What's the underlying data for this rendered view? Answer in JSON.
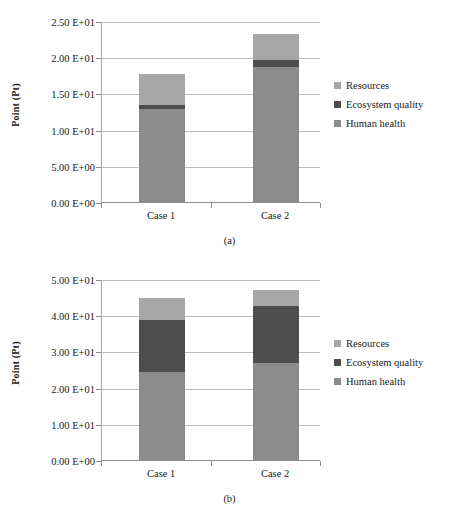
{
  "figure": {
    "background": "#ffffff",
    "series_colors": {
      "human_health": "#8c8c8c",
      "ecosystem_quality": "#4d4d4d",
      "resources": "#a6a6a6"
    },
    "panels": [
      {
        "id": "a",
        "caption": "(a)",
        "chart_data": {
          "type": "bar",
          "stacked": true,
          "title": "",
          "xlabel": "",
          "ylabel": "Point (Pt)",
          "categories": [
            "Case 1",
            "Case 2"
          ],
          "ylim": [
            0,
            25
          ],
          "ytick_values": [
            0,
            5,
            10,
            15,
            20,
            25
          ],
          "ytick_labels": [
            "0.00 E+00",
            "5.00 E+00",
            "1.00 E+01",
            "1.50 E+01",
            "2.00 E+01",
            "2.50 E+01"
          ],
          "grid": true,
          "legend_position": "right",
          "series": [
            {
              "name": "Human health",
              "values": [
                13.0,
                18.8
              ]
            },
            {
              "name": "Ecosystem quality",
              "values": [
                0.6,
                1.0
              ]
            },
            {
              "name": "Resources",
              "values": [
                4.2,
                3.5
              ]
            }
          ],
          "totals": [
            17.8,
            23.3
          ]
        },
        "legend": [
          {
            "label": "Resources",
            "color": "#a6a6a6"
          },
          {
            "label": "Ecosystem quality",
            "color": "#4d4d4d"
          },
          {
            "label": "Human health",
            "color": "#8c8c8c"
          }
        ]
      },
      {
        "id": "b",
        "caption": "(b)",
        "chart_data": {
          "type": "bar",
          "stacked": true,
          "title": "",
          "xlabel": "",
          "ylabel": "Point (Pt)",
          "categories": [
            "Case 1",
            "Case 2"
          ],
          "ylim": [
            0,
            50
          ],
          "ytick_values": [
            0,
            10,
            20,
            30,
            40,
            50
          ],
          "ytick_labels": [
            "0.00 E+00",
            "1.00 E+01",
            "2.00 E+01",
            "3.00 E+01",
            "4.00 E+01",
            "5.00 E+01"
          ],
          "grid": true,
          "legend_position": "right",
          "series": [
            {
              "name": "Human health",
              "values": [
                24.5,
                27.0
              ]
            },
            {
              "name": "Ecosystem quality",
              "values": [
                14.5,
                15.8
              ]
            },
            {
              "name": "Resources",
              "values": [
                6.0,
                4.4
              ]
            }
          ],
          "totals": [
            45.0,
            47.2
          ]
        },
        "legend": [
          {
            "label": "Resources",
            "color": "#a6a6a6"
          },
          {
            "label": "Ecosystem quality",
            "color": "#4d4d4d"
          },
          {
            "label": "Human health",
            "color": "#8c8c8c"
          }
        ]
      }
    ]
  }
}
